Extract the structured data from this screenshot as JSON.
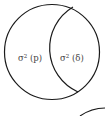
{
  "diagram": {
    "type": "venn",
    "stroke_color": "#1a1a1a",
    "text_color": "#444444",
    "regions": [
      {
        "id": "left",
        "label_base": "σ",
        "label_sup": "2",
        "label_arg": " (p)"
      },
      {
        "id": "overlap",
        "label_base": "σ",
        "label_sup": "2",
        "label_arg": " (δ)"
      }
    ]
  }
}
